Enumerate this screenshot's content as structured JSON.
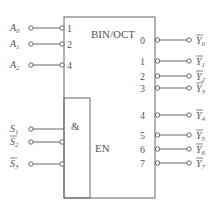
{
  "diagram": {
    "title": "BIN/OCT",
    "control_block": {
      "gate": "&",
      "enable": "EN"
    },
    "inputs": [
      {
        "name": "A",
        "sub": "0",
        "pin": "1",
        "y": 28,
        "inverted": false,
        "active_low_bubble": true
      },
      {
        "name": "A",
        "sub": "1",
        "pin": "2",
        "y": 44,
        "inverted": false,
        "active_low_bubble": true
      },
      {
        "name": "A",
        "sub": "2",
        "pin": "4",
        "y": 65,
        "inverted": false,
        "active_low_bubble": true
      }
    ],
    "enables": [
      {
        "name": "S",
        "sub": "1",
        "y": 129,
        "overbar": false,
        "bubble": false
      },
      {
        "name": "S",
        "sub": "2",
        "y": 142,
        "overbar": true,
        "bubble": true
      },
      {
        "name": "S",
        "sub": "3",
        "y": 164,
        "overbar": true,
        "bubble": true
      }
    ],
    "outputs": [
      {
        "pin": "0",
        "name": "Y",
        "sub": "0",
        "y": 40
      },
      {
        "pin": "1",
        "name": "Y",
        "sub": "1",
        "y": 61
      },
      {
        "pin": "2",
        "name": "Y",
        "sub": "2",
        "y": 76
      },
      {
        "pin": "3",
        "name": "Y",
        "sub": "3",
        "y": 88
      },
      {
        "pin": "4",
        "name": "Y",
        "sub": "4",
        "y": 115
      },
      {
        "pin": "5",
        "name": "Y",
        "sub": "5",
        "y": 135
      },
      {
        "pin": "6",
        "name": "Y",
        "sub": "6",
        "y": 149
      },
      {
        "pin": "7",
        "name": "Y",
        "sub": "7",
        "y": 163
      }
    ],
    "colors": {
      "line": "#666666",
      "text": "#555555",
      "background": "#ffffff"
    }
  }
}
